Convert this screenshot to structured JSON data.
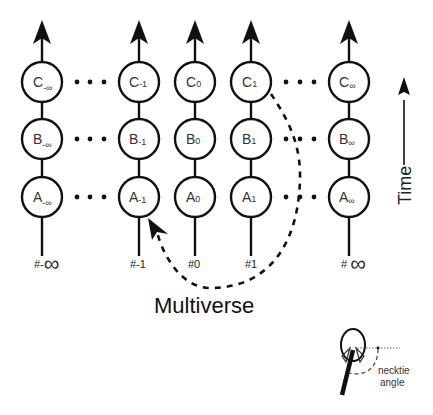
{
  "diagram": {
    "title": "Multiverse",
    "time_axis_label": "Time",
    "columns": [
      {
        "index_label": "#-",
        "index_symbol": "∞",
        "nodes": [
          {
            "letter": "C",
            "sub": "-∞"
          },
          {
            "letter": "B",
            "sub": "-∞"
          },
          {
            "letter": "A",
            "sub": "-∞"
          }
        ]
      },
      {
        "index_label": "#-1",
        "index_symbol": "",
        "nodes": [
          {
            "letter": "C",
            "sub": "-1"
          },
          {
            "letter": "B",
            "sub": "-1"
          },
          {
            "letter": "A",
            "sub": "-1"
          }
        ]
      },
      {
        "index_label": "#0",
        "index_symbol": "",
        "nodes": [
          {
            "letter": "C",
            "sub": "0"
          },
          {
            "letter": "B",
            "sub": "0"
          },
          {
            "letter": "A",
            "sub": "0"
          }
        ]
      },
      {
        "index_label": "#1",
        "index_symbol": "",
        "nodes": [
          {
            "letter": "C",
            "sub": "1"
          },
          {
            "letter": "B",
            "sub": "1"
          },
          {
            "letter": "A",
            "sub": "1"
          }
        ]
      },
      {
        "index_label": "# ",
        "index_symbol": "∞",
        "nodes": [
          {
            "letter": "C",
            "sub": "∞"
          },
          {
            "letter": "B",
            "sub": "∞"
          },
          {
            "letter": "A",
            "sub": "∞"
          }
        ]
      }
    ],
    "ellipsis": "• • •",
    "dashed_path": {
      "from": "C1",
      "to": "A-1",
      "style": "dashed-arrow"
    },
    "inset": {
      "label_line1": "necktie",
      "label_line2": "angle",
      "icon": "necktie-figure-icon"
    }
  }
}
